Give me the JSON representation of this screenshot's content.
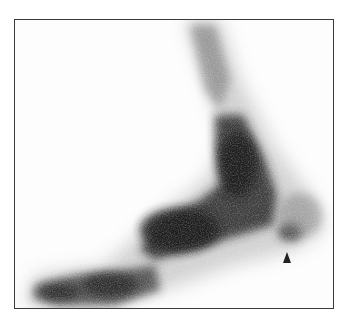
{
  "image": {
    "description": "Grayscale scintigraphic (bone scan) image of a foot in lateral projection inside a rectangular frame",
    "annotation": {
      "type": "arrowhead",
      "direction": "up",
      "color": "#222222"
    },
    "colors": {
      "background": "#ffffff",
      "frame": "#3a3a3a",
      "uptake_dark": "#1e1e1e",
      "uptake_light": "#9a9a9a"
    }
  }
}
